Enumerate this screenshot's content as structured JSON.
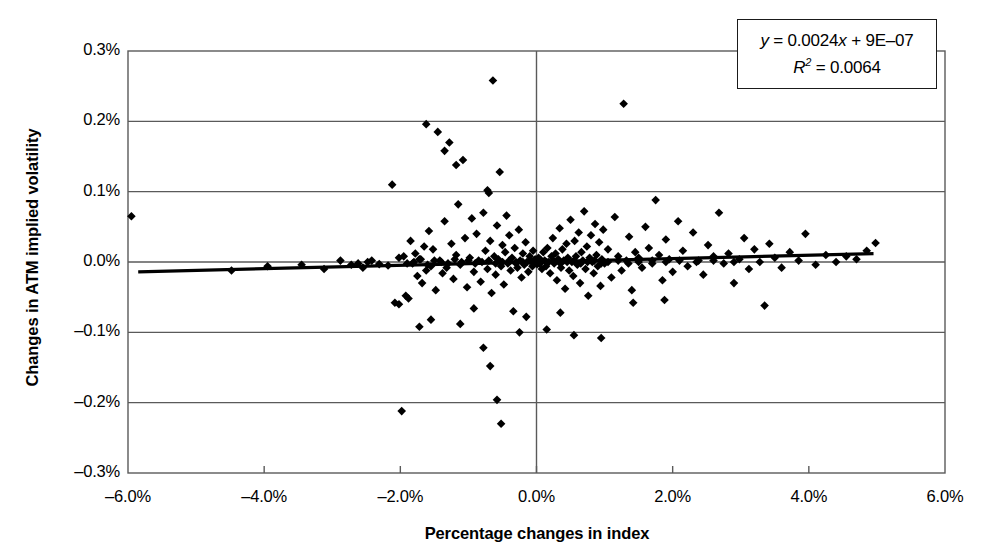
{
  "chart_data": {
    "type": "scatter",
    "title": "",
    "xlabel": "Percentage changes in index",
    "ylabel": "Changes in ATM implied volatility",
    "xlim": [
      -6.0,
      6.0
    ],
    "ylim": [
      -0.3,
      0.3
    ],
    "xticks": [
      "–6.0%",
      "–4.0%",
      "–2.0%",
      "0.0%",
      "2.0%",
      "4.0%",
      "6.0%"
    ],
    "xtick_values": [
      -6.0,
      -4.0,
      -2.0,
      0.0,
      2.0,
      4.0,
      6.0
    ],
    "yticks": [
      "0.3%",
      "0.2%",
      "0.1%",
      "0.0%",
      "–0.1%",
      "–0.2%",
      "–0.3%"
    ],
    "ytick_values": [
      0.3,
      0.2,
      0.1,
      0.0,
      -0.1,
      -0.2,
      -0.3
    ],
    "grid": "horizontal",
    "legend": "none",
    "marker": "diamond",
    "marker_color": "#000000",
    "series": [
      {
        "name": "Index change vs ATM implied volatility change",
        "points": [
          [
            -5.95,
            0.065
          ],
          [
            -4.48,
            -0.012
          ],
          [
            -3.95,
            -0.006
          ],
          [
            -3.12,
            -0.01
          ],
          [
            -2.72,
            -0.004
          ],
          [
            -2.55,
            -0.008
          ],
          [
            -2.42,
            0.002
          ],
          [
            -2.31,
            -0.003
          ],
          [
            -2.18,
            -0.005
          ],
          [
            -2.12,
            0.11
          ],
          [
            -2.08,
            -0.058
          ],
          [
            -2.02,
            -0.06
          ],
          [
            -1.98,
            -0.212
          ],
          [
            -1.95,
            0.008
          ],
          [
            -1.92,
            -0.048
          ],
          [
            -1.88,
            -0.052
          ],
          [
            -1.85,
            0.03
          ],
          [
            -1.82,
            -0.002
          ],
          [
            -1.78,
            0.012
          ],
          [
            -1.75,
            -0.02
          ],
          [
            -1.72,
            0.004
          ],
          [
            -1.68,
            -0.03
          ],
          [
            -1.65,
            0.022
          ],
          [
            -1.62,
            -0.012
          ],
          [
            -1.58,
            0.044
          ],
          [
            -1.55,
            -0.006
          ],
          [
            -1.52,
            0.018
          ],
          [
            -1.48,
            -0.04
          ],
          [
            -1.45,
            0.185
          ],
          [
            -1.42,
            0.002
          ],
          [
            -1.38,
            -0.016
          ],
          [
            -1.35,
            0.058
          ],
          [
            -1.32,
            -0.008
          ],
          [
            -1.28,
            0.17
          ],
          [
            -1.25,
            0.026
          ],
          [
            -1.22,
            -0.024
          ],
          [
            -1.18,
            0.01
          ],
          [
            -1.15,
            0.082
          ],
          [
            -1.12,
            -0.004
          ],
          [
            -1.08,
            0.145
          ],
          [
            -1.05,
            0.034
          ],
          [
            -1.02,
            -0.036
          ],
          [
            -0.98,
            0.006
          ],
          [
            -0.95,
            0.062
          ],
          [
            -0.92,
            -0.014
          ],
          [
            -0.88,
            0.04
          ],
          [
            -0.85,
            0.002
          ],
          [
            -0.82,
            -0.028
          ],
          [
            -0.78,
            0.07
          ],
          [
            -0.75,
            0.016
          ],
          [
            -0.72,
            -0.01
          ],
          [
            -0.7,
            0.098
          ],
          [
            -0.68,
            0.03
          ],
          [
            -0.66,
            -0.044
          ],
          [
            -0.64,
            0.258
          ],
          [
            -0.62,
            0.008
          ],
          [
            -0.6,
            -0.018
          ],
          [
            -0.58,
            0.052
          ],
          [
            -0.56,
            0.004
          ],
          [
            -0.54,
            0.128
          ],
          [
            -0.52,
            -0.006
          ],
          [
            -0.5,
            0.024
          ],
          [
            -0.48,
            -0.032
          ],
          [
            -0.46,
            0.014
          ],
          [
            -0.44,
            0.066
          ],
          [
            -0.42,
            -0.002
          ],
          [
            -0.4,
            0.038
          ],
          [
            -0.38,
            -0.012
          ],
          [
            -0.36,
            0.006
          ],
          [
            -0.34,
            -0.07
          ],
          [
            -0.32,
            0.02
          ],
          [
            -0.3,
            0.0
          ],
          [
            -0.28,
            -0.008
          ],
          [
            -0.26,
            0.046
          ],
          [
            -0.24,
            0.002
          ],
          [
            -0.22,
            -0.022
          ],
          [
            -0.2,
            0.012
          ],
          [
            -0.18,
            -0.004
          ],
          [
            -0.16,
            0.028
          ],
          [
            -0.14,
            0.0
          ],
          [
            -0.12,
            -0.014
          ],
          [
            -0.1,
            0.008
          ],
          [
            -0.08,
            0.002
          ],
          [
            -0.06,
            -0.006
          ],
          [
            -0.05,
            0.016
          ],
          [
            -0.04,
            0.0
          ],
          [
            -0.03,
            -0.002
          ],
          [
            -0.02,
            0.004
          ],
          [
            -0.01,
            -0.001
          ],
          [
            0.0,
            0.002
          ],
          [
            0.01,
            -0.003
          ],
          [
            0.02,
            0.001
          ],
          [
            0.03,
            0.006
          ],
          [
            0.04,
            -0.002
          ],
          [
            0.05,
            0.0
          ],
          [
            0.06,
            0.003
          ],
          [
            0.08,
            -0.01
          ],
          [
            0.1,
            0.014
          ],
          [
            0.12,
            0.002
          ],
          [
            0.14,
            -0.006
          ],
          [
            0.16,
            0.02
          ],
          [
            0.18,
            0.0
          ],
          [
            0.2,
            -0.016
          ],
          [
            0.22,
            0.008
          ],
          [
            0.24,
            0.034
          ],
          [
            0.26,
            -0.002
          ],
          [
            0.28,
            0.012
          ],
          [
            0.3,
            -0.026
          ],
          [
            0.32,
            0.004
          ],
          [
            0.34,
            0.048
          ],
          [
            0.36,
            -0.008
          ],
          [
            0.38,
            0.018
          ],
          [
            0.4,
            0.002
          ],
          [
            0.42,
            -0.038
          ],
          [
            0.44,
            0.026
          ],
          [
            0.46,
            0.006
          ],
          [
            0.48,
            -0.012
          ],
          [
            0.5,
            0.06
          ],
          [
            0.52,
            0.0
          ],
          [
            0.54,
            -0.02
          ],
          [
            0.56,
            0.03
          ],
          [
            0.58,
            0.008
          ],
          [
            0.6,
            -0.004
          ],
          [
            0.62,
            0.042
          ],
          [
            0.64,
            -0.03
          ],
          [
            0.66,
            0.014
          ],
          [
            0.68,
            0.002
          ],
          [
            0.7,
            0.072
          ],
          [
            0.72,
            -0.01
          ],
          [
            0.74,
            0.022
          ],
          [
            0.76,
            -0.048
          ],
          [
            0.78,
            0.006
          ],
          [
            0.8,
            0.038
          ],
          [
            0.82,
            0.0
          ],
          [
            0.84,
            -0.016
          ],
          [
            0.86,
            0.054
          ],
          [
            0.88,
            0.01
          ],
          [
            0.9,
            -0.006
          ],
          [
            0.92,
            0.028
          ],
          [
            0.94,
            -0.034
          ],
          [
            0.96,
            0.004
          ],
          [
            0.98,
            0.046
          ],
          [
            1.0,
            -0.002
          ],
          [
            1.05,
            0.018
          ],
          [
            1.1,
            -0.022
          ],
          [
            1.15,
            0.064
          ],
          [
            1.2,
            0.008
          ],
          [
            1.25,
            -0.012
          ],
          [
            1.28,
            0.225
          ],
          [
            1.32,
            0.002
          ],
          [
            1.36,
            0.036
          ],
          [
            1.4,
            -0.04
          ],
          [
            1.45,
            0.014
          ],
          [
            1.5,
            0.006
          ],
          [
            1.55,
            -0.008
          ],
          [
            1.6,
            0.05
          ],
          [
            1.65,
            0.02
          ],
          [
            1.7,
            -0.002
          ],
          [
            1.75,
            0.088
          ],
          [
            1.8,
            0.01
          ],
          [
            1.85,
            -0.026
          ],
          [
            1.9,
            0.032
          ],
          [
            1.95,
            0.004
          ],
          [
            2.0,
            -0.014
          ],
          [
            2.08,
            0.058
          ],
          [
            2.15,
            0.016
          ],
          [
            2.22,
            -0.006
          ],
          [
            2.3,
            0.042
          ],
          [
            2.38,
            0.002
          ],
          [
            2.45,
            -0.018
          ],
          [
            2.52,
            0.024
          ],
          [
            2.6,
            0.008
          ],
          [
            2.68,
            0.07
          ],
          [
            2.75,
            -0.002
          ],
          [
            2.82,
            0.012
          ],
          [
            2.9,
            -0.03
          ],
          [
            2.98,
            0.004
          ],
          [
            3.05,
            0.034
          ],
          [
            3.12,
            -0.01
          ],
          [
            3.2,
            0.018
          ],
          [
            3.28,
            0.0
          ],
          [
            3.35,
            -0.062
          ],
          [
            3.42,
            0.026
          ],
          [
            3.5,
            0.006
          ],
          [
            3.6,
            -0.008
          ],
          [
            3.72,
            0.014
          ],
          [
            3.85,
            0.002
          ],
          [
            3.95,
            0.04
          ],
          [
            4.1,
            -0.004
          ],
          [
            4.25,
            0.01
          ],
          [
            4.4,
            0.0
          ],
          [
            4.55,
            0.008
          ],
          [
            4.7,
            0.004
          ],
          [
            4.85,
            0.016
          ],
          [
            4.98,
            0.027
          ],
          [
            -1.62,
            0.196
          ],
          [
            -1.35,
            0.158
          ],
          [
            -1.18,
            0.138
          ],
          [
            -0.72,
            0.102
          ],
          [
            -1.72,
            -0.092
          ],
          [
            -1.55,
            -0.082
          ],
          [
            -1.12,
            -0.088
          ],
          [
            -0.92,
            -0.066
          ],
          [
            -0.78,
            -0.122
          ],
          [
            -0.68,
            -0.148
          ],
          [
            -0.58,
            -0.196
          ],
          [
            -0.52,
            -0.23
          ],
          [
            -0.25,
            -0.1
          ],
          [
            0.15,
            -0.096
          ],
          [
            0.55,
            -0.104
          ],
          [
            0.95,
            -0.108
          ],
          [
            1.42,
            -0.058
          ],
          [
            1.88,
            -0.054
          ],
          [
            0.35,
            -0.072
          ],
          [
            -0.15,
            -0.078
          ],
          [
            -2.02,
            0.006
          ],
          [
            -1.9,
            -0.002
          ],
          [
            -1.8,
            0.0
          ],
          [
            -1.7,
            0.004
          ],
          [
            -1.6,
            -0.004
          ],
          [
            -1.5,
            0.002
          ],
          [
            -1.4,
            0.0
          ],
          [
            -1.3,
            -0.002
          ],
          [
            -1.2,
            0.004
          ],
          [
            -1.1,
            0.0
          ],
          [
            -1.0,
            0.002
          ],
          [
            -0.9,
            -0.002
          ],
          [
            -0.8,
            0.0
          ],
          [
            -0.7,
            0.002
          ],
          [
            -0.6,
            -0.002
          ],
          [
            -0.5,
            0.0
          ],
          [
            -0.4,
            0.002
          ],
          [
            -0.3,
            -0.002
          ],
          [
            -0.2,
            0.0
          ],
          [
            -0.1,
            0.002
          ],
          [
            0.05,
            -0.002
          ],
          [
            0.15,
            0.0
          ],
          [
            0.25,
            0.002
          ],
          [
            0.35,
            -0.002
          ],
          [
            0.45,
            0.0
          ],
          [
            0.55,
            0.002
          ],
          [
            0.65,
            -0.002
          ],
          [
            0.75,
            0.0
          ],
          [
            0.85,
            0.002
          ],
          [
            0.95,
            -0.002
          ],
          [
            1.05,
            0.0
          ],
          [
            1.2,
            0.002
          ],
          [
            1.35,
            -0.002
          ],
          [
            1.5,
            0.0
          ],
          [
            1.7,
            0.002
          ],
          [
            1.9,
            0.0
          ],
          [
            2.1,
            0.002
          ],
          [
            2.35,
            0.0
          ],
          [
            2.6,
            0.002
          ],
          [
            2.9,
            0.0
          ],
          [
            -2.48,
            0.0
          ],
          [
            -2.62,
            -0.002
          ],
          [
            -2.88,
            0.002
          ],
          [
            -3.45,
            -0.004
          ]
        ]
      }
    ],
    "trendline": {
      "equation_y": "y = 0.0024x + 9E–07",
      "equation_r2": "R² = 0.0064",
      "slope": 0.0024,
      "intercept": 9e-07,
      "r_squared": 0.0064,
      "x_start": -5.85,
      "x_end": 4.95,
      "y_start": -0.014,
      "y_end": 0.012
    },
    "equation_label_y_prefix": "y",
    "equation_label_y_rest": " = 0.0024",
    "equation_label_y_var": "x",
    "equation_label_y_tail": " + 9E–07",
    "equation_label_r": "R",
    "equation_label_r_sup": "2",
    "equation_label_r_tail": " = 0.0064"
  }
}
